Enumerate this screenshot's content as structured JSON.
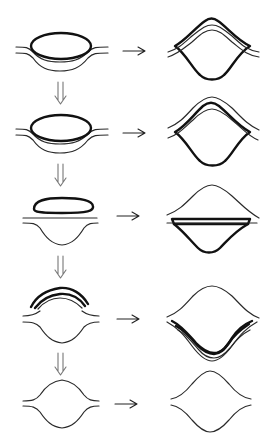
{
  "diagram": {
    "rows": [
      {
        "step": 1,
        "left": "thick ellipse resting on two parallel curved layers",
        "right": "diamond-like shape with thick outline and two thin parallel curves across top"
      },
      {
        "step": 2,
        "left": "thick ellipse resting on two parallel curved layers",
        "right": "diamond-like shape with thick upper curve between two thin curves"
      },
      {
        "step": 3,
        "left": "flattened thick lozenge above a straight line and a bowl curve",
        "right": "thin bump above a thick flat band with thick bowl beneath"
      },
      {
        "step": 4,
        "left": "thick arched band above a lens-shaped opening",
        "right": "thin dome above thick U-shaped band inside thin curves"
      },
      {
        "step": 5,
        "left": "lens-shaped opening between two thin curves",
        "right": "pointed lens shape between two thin curves"
      }
    ],
    "arrows": {
      "right": "→",
      "down": "⇓"
    },
    "colors": {
      "line": "#111111",
      "thin_line": "#2a2a2a",
      "down_arrow": "#777777",
      "background": "#ffffff"
    }
  }
}
